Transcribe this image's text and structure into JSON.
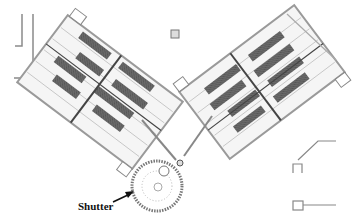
{
  "diagram": {
    "type": "facility-layout-plan",
    "colors": {
      "background": "#ffffff",
      "line": "#8a8a8a",
      "dark_fill": "#6a6a6a",
      "light_fill": "#f2f2f2",
      "label": "#111111"
    },
    "components": [
      {
        "id": "left-hall",
        "description": "rectangular hall rotated ~45deg, rows of dark modules"
      },
      {
        "id": "right-hall",
        "description": "rectangular hall rotated ~-45deg, rows of dark modules"
      },
      {
        "id": "beam-line-left",
        "description": "line from left hall to shutter wheel"
      },
      {
        "id": "beam-line-right",
        "description": "line from right hall to shutter wheel"
      },
      {
        "id": "shutter-wheel",
        "description": "circular toothed wheel at bottom center"
      },
      {
        "id": "small-target",
        "description": "small square marker at top center"
      }
    ],
    "labels": [
      {
        "text": "Shutter",
        "points_to": "shutter-wheel"
      }
    ]
  }
}
